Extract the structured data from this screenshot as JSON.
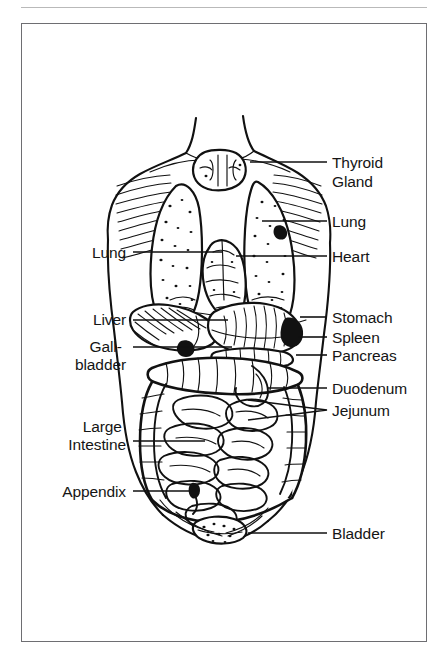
{
  "figure": {
    "line_color": "#111111",
    "frame_color": "#6e6e72",
    "background": "#ffffff"
  },
  "labels": {
    "left": [
      {
        "id": "lung-left",
        "lines": [
          "Lung"
        ],
        "x": 126,
        "y": 258,
        "leader_from": [
          133,
          252
        ],
        "leader_to": [
          222,
          252
        ]
      },
      {
        "id": "liver",
        "lines": [
          "Liver"
        ],
        "x": 126,
        "y": 325,
        "leader_from": [
          133,
          320
        ],
        "leader_to": [
          228,
          320
        ]
      },
      {
        "id": "gallbladder",
        "lines": [
          "Gall-",
          "bladder"
        ],
        "x": 126,
        "y": 352,
        "leader_from": [
          133,
          347
        ],
        "leader_to": [
          232,
          347
        ]
      },
      {
        "id": "large-intestine",
        "lines": [
          "Large",
          "Intestine"
        ],
        "x": 126,
        "y": 432,
        "leader_from": [
          133,
          441
        ],
        "leader_to": [
          205,
          441
        ]
      },
      {
        "id": "appendix",
        "lines": [
          "Appendix"
        ],
        "x": 126,
        "y": 497,
        "leader_from": [
          133,
          491
        ],
        "leader_to": [
          196,
          491
        ]
      }
    ],
    "right": [
      {
        "id": "thyroid-gland",
        "lines": [
          "Thyroid",
          "Gland"
        ],
        "x": 332,
        "y": 168,
        "leader_from": [
          250,
          162
        ],
        "leader_to": [
          327,
          162
        ]
      },
      {
        "id": "lung-right",
        "lines": [
          "Lung"
        ],
        "x": 332,
        "y": 227,
        "leader_from": [
          262,
          221
        ],
        "leader_to": [
          327,
          221
        ]
      },
      {
        "id": "heart",
        "lines": [
          "Heart"
        ],
        "x": 332,
        "y": 262,
        "leader_from": [
          236,
          256
        ],
        "leader_to": [
          327,
          256
        ]
      },
      {
        "id": "stomach",
        "lines": [
          "Stomach"
        ],
        "x": 332,
        "y": 323,
        "leader_from": [
          300,
          317
        ],
        "leader_to": [
          327,
          317
        ]
      },
      {
        "id": "spleen",
        "lines": [
          "Spleen"
        ],
        "x": 332,
        "y": 343,
        "leader_from": [
          298,
          337
        ],
        "leader_to": [
          327,
          337
        ]
      },
      {
        "id": "pancreas",
        "lines": [
          "Pancreas"
        ],
        "x": 332,
        "y": 361,
        "leader_from": [
          296,
          355
        ],
        "leader_to": [
          327,
          355
        ]
      },
      {
        "id": "duodenum",
        "lines": [
          "Duodenum"
        ],
        "x": 332,
        "y": 394,
        "leader_from": [
          268,
          388
        ],
        "leader_to": [
          327,
          388
        ]
      },
      {
        "id": "jejunum",
        "lines": [
          "Jejunum"
        ],
        "x": 332,
        "y": 416,
        "leader_from": [
          248,
          400
        ],
        "leader_to": [
          327,
          410
        ],
        "leader_from2": [
          248,
          420
        ],
        "leader_to2": [
          327,
          410
        ]
      },
      {
        "id": "bladder",
        "lines": [
          "Bladder"
        ],
        "x": 332,
        "y": 539,
        "leader_from": [
          248,
          533
        ],
        "leader_to": [
          327,
          533
        ]
      }
    ]
  },
  "organs": [
    "thyroid gland",
    "left lung",
    "right lung",
    "heart",
    "liver",
    "gallbladder",
    "stomach",
    "spleen",
    "pancreas",
    "duodenum",
    "jejunum",
    "large intestine",
    "appendix",
    "bladder"
  ]
}
